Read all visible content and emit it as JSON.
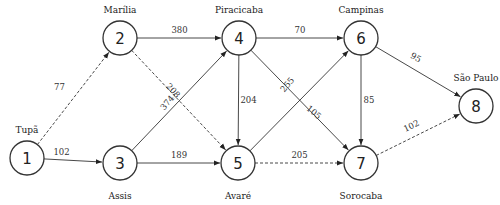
{
  "diagram": {
    "type": "directed-weighted-graph",
    "nodes": [
      {
        "id": "1",
        "label": "1",
        "city": "Tupã",
        "x": 27,
        "y": 158
      },
      {
        "id": "2",
        "label": "2",
        "city": "Marília",
        "x": 120,
        "y": 38
      },
      {
        "id": "3",
        "label": "3",
        "city": "Assis",
        "x": 120,
        "y": 163
      },
      {
        "id": "4",
        "label": "4",
        "city": "Piracicaba",
        "x": 239,
        "y": 38
      },
      {
        "id": "5",
        "label": "5",
        "city": "Avaré",
        "x": 238,
        "y": 163
      },
      {
        "id": "6",
        "label": "6",
        "city": "Campinas",
        "x": 361,
        "y": 38
      },
      {
        "id": "7",
        "label": "7",
        "city": "Sorocaba",
        "x": 361,
        "y": 163
      },
      {
        "id": "8",
        "label": "8",
        "city": "São Paulo",
        "x": 476,
        "y": 106
      }
    ],
    "edges": [
      {
        "from": "1",
        "to": "2",
        "weight": "77",
        "style": "dashed"
      },
      {
        "from": "1",
        "to": "3",
        "weight": "102",
        "style": "solid"
      },
      {
        "from": "2",
        "to": "4",
        "weight": "380",
        "style": "solid"
      },
      {
        "from": "2",
        "to": "5",
        "weight": "208",
        "style": "dashed"
      },
      {
        "from": "3",
        "to": "4",
        "weight": "374",
        "style": "solid"
      },
      {
        "from": "3",
        "to": "5",
        "weight": "189",
        "style": "solid"
      },
      {
        "from": "4",
        "to": "5",
        "weight": "204",
        "style": "solid"
      },
      {
        "from": "4",
        "to": "6",
        "weight": "70",
        "style": "solid"
      },
      {
        "from": "4",
        "to": "7",
        "weight": "105",
        "style": "solid"
      },
      {
        "from": "5",
        "to": "6",
        "weight": "255",
        "style": "solid"
      },
      {
        "from": "5",
        "to": "7",
        "weight": "205",
        "style": "dashed"
      },
      {
        "from": "6",
        "to": "7",
        "weight": "85",
        "style": "solid"
      },
      {
        "from": "6",
        "to": "8",
        "weight": "95",
        "style": "solid"
      },
      {
        "from": "7",
        "to": "8",
        "weight": "102",
        "style": "dashed"
      }
    ],
    "colors": {
      "stroke": "#333333",
      "text": "#222222",
      "background": "#ffffff"
    }
  }
}
